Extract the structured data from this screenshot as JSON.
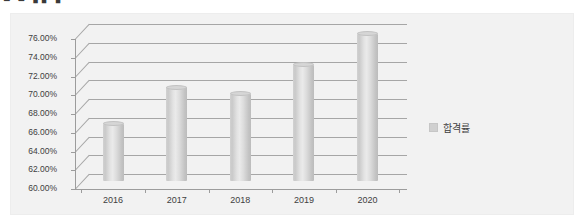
{
  "top_strip": {
    "clipped_text": "■ ■ ▮▮ ▮ · · ·"
  },
  "chart_data": {
    "type": "bar",
    "title": "",
    "subtitle": "",
    "xlabel": "",
    "ylabel": "",
    "categories": [
      "2016",
      "2017",
      "2018",
      "2019",
      "2020"
    ],
    "series": [
      {
        "name": "합격률",
        "values": [
          66.1,
          70.0,
          69.3,
          72.4,
          75.7
        ]
      }
    ],
    "ylim": [
      60.0,
      76.0
    ],
    "y_ticks": [
      60.0,
      62.0,
      64.0,
      66.0,
      68.0,
      70.0,
      72.0,
      74.0,
      76.0
    ],
    "y_tick_labels": [
      "60.00%",
      "62.00%",
      "64.00%",
      "66.00%",
      "68.00%",
      "70.00%",
      "72.00%",
      "74.00%",
      "76.00%"
    ],
    "grid": true,
    "legend_position": "right",
    "legend_entries": [
      "합격률"
    ],
    "style": "3d-cylinder",
    "colors": {
      "bar": "#d6d6d6",
      "plot_background": "#f2f2f2",
      "gridline": "#a6a6a6",
      "axis": "#9c9c9c",
      "text": "#404040"
    }
  },
  "legend": {
    "label": "합격률"
  }
}
